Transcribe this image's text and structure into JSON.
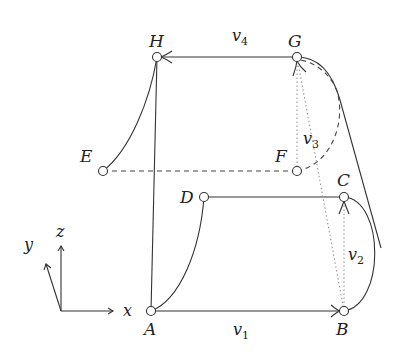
{
  "diagram": {
    "type": "graph-on-cube-projection",
    "vertices": {
      "A": {
        "label": "A",
        "x": 151,
        "y": 311
      },
      "B": {
        "label": "B",
        "x": 344,
        "y": 311
      },
      "C": {
        "label": "C",
        "x": 344,
        "y": 197
      },
      "D": {
        "label": "D",
        "x": 204,
        "y": 197
      },
      "E": {
        "label": "E",
        "x": 103,
        "y": 171
      },
      "F": {
        "label": "F",
        "x": 297,
        "y": 171
      },
      "G": {
        "label": "G",
        "x": 297,
        "y": 57
      },
      "H": {
        "label": "H",
        "x": 157,
        "y": 57
      }
    },
    "edge_labels": {
      "v1": "v",
      "v1_sub": "1",
      "v2": "v",
      "v2_sub": "2",
      "v3": "v",
      "v3_sub": "3",
      "v4": "v",
      "v4_sub": "4"
    },
    "edges": [
      {
        "from": "A",
        "to": "B",
        "style": "solid",
        "arrow": true,
        "label": "v1"
      },
      {
        "from": "B",
        "to": "C",
        "style": "dotted",
        "arrow": true,
        "label": "v2"
      },
      {
        "from": "F",
        "to": "G",
        "style": "dotted",
        "arrow": true,
        "label": "v3"
      },
      {
        "from": "G",
        "to": "H",
        "style": "solid",
        "arrow": true,
        "label": "v4"
      },
      {
        "from": "H",
        "to": "A",
        "style": "solid",
        "arrow": false
      },
      {
        "from": "H",
        "to": "E",
        "style": "solid-curve",
        "arrow": false
      },
      {
        "from": "E",
        "to": "F",
        "style": "dashed",
        "arrow": false
      },
      {
        "from": "A",
        "to": "D",
        "style": "solid-curve",
        "arrow": false
      },
      {
        "from": "D",
        "to": "C",
        "style": "solid",
        "arrow": false
      },
      {
        "from": "C",
        "to": "B",
        "style": "solid-curve",
        "arrow": false
      },
      {
        "from": "G",
        "to": "B",
        "style": "solid-curve",
        "arrow": false
      },
      {
        "from": "F",
        "to": "G",
        "style": "dashed-curve",
        "arrow": false
      },
      {
        "from": "B",
        "to": "G",
        "style": "dotted",
        "arrow": false
      }
    ],
    "axes": {
      "x_label": "x",
      "y_label": "y",
      "z_label": "z"
    }
  }
}
